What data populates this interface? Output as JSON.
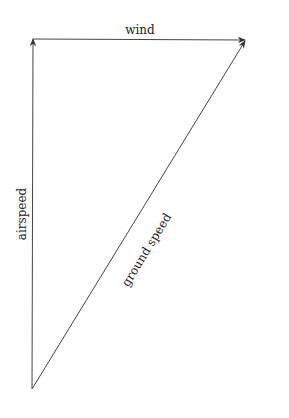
{
  "diagram": {
    "type": "vector-triangle",
    "vectors": [
      {
        "name": "airspeed",
        "label": "airspeed",
        "from": [
          32,
          389
        ],
        "to": [
          33,
          38
        ]
      },
      {
        "name": "wind",
        "label": "wind",
        "from": [
          33,
          39
        ],
        "to": [
          246,
          40
        ]
      },
      {
        "name": "ground-speed",
        "label": "ground speed",
        "from": [
          32,
          389
        ],
        "to": [
          246,
          40
        ]
      }
    ],
    "colors": {
      "line": "#333333",
      "text": "#222222",
      "background": "#ffffff"
    }
  },
  "labels": {
    "wind": "wind",
    "airspeed": "airspeed",
    "ground_speed": "ground speed"
  }
}
